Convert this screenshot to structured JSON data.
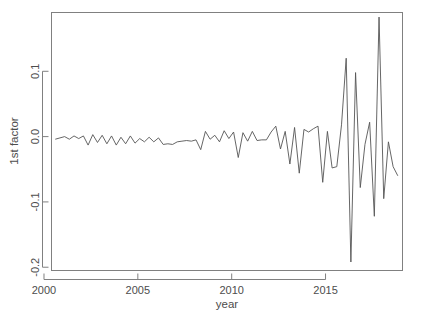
{
  "chart_data": {
    "type": "line",
    "title": "",
    "xlabel": "year",
    "ylabel": "1st factor",
    "xlim": [
      2000.4,
      2019.1
    ],
    "ylim": [
      -0.205,
      0.19
    ],
    "grid": false,
    "legend": "none",
    "x_ticks": [
      "2000",
      "2005",
      "2010",
      "2015"
    ],
    "x_tick_values": [
      2000,
      2005,
      2010,
      2015
    ],
    "y_ticks": [
      "0.1",
      "0.0",
      "-0.1",
      "-0.2"
    ],
    "y_tick_values": [
      0.1,
      0.0,
      -0.1,
      -0.2
    ],
    "series": [
      {
        "name": "1st factor",
        "x": [
          2000.6,
          2000.85,
          2001.1,
          2001.35,
          2001.6,
          2001.85,
          2002.1,
          2002.35,
          2002.6,
          2002.85,
          2003.1,
          2003.35,
          2003.6,
          2003.85,
          2004.1,
          2004.35,
          2004.6,
          2004.85,
          2005.1,
          2005.35,
          2005.6,
          2005.85,
          2006.1,
          2006.35,
          2006.6,
          2006.85,
          2007.1,
          2007.35,
          2007.6,
          2007.85,
          2008.1,
          2008.35,
          2008.6,
          2008.85,
          2009.1,
          2009.35,
          2009.6,
          2009.85,
          2010.1,
          2010.35,
          2010.6,
          2010.85,
          2011.1,
          2011.35,
          2011.6,
          2011.85,
          2012.1,
          2012.35,
          2012.6,
          2012.85,
          2013.1,
          2013.35,
          2013.6,
          2013.85,
          2014.1,
          2014.35,
          2014.6,
          2014.85,
          2015.1,
          2015.35,
          2015.6,
          2015.85,
          2016.1,
          2016.35,
          2016.6,
          2016.85,
          2017.1,
          2017.35,
          2017.6,
          2017.85,
          2018.1,
          2018.35,
          2018.6,
          2018.85
        ],
        "values": [
          -0.004,
          -0.002,
          0.0,
          -0.004,
          0.001,
          -0.003,
          0.001,
          -0.013,
          0.003,
          -0.009,
          0.002,
          -0.011,
          0.001,
          -0.013,
          -0.001,
          -0.011,
          0.001,
          -0.01,
          -0.003,
          -0.008,
          -0.001,
          -0.008,
          -0.002,
          -0.012,
          -0.011,
          -0.012,
          -0.008,
          -0.007,
          -0.006,
          -0.007,
          -0.005,
          -0.02,
          0.008,
          -0.004,
          0.002,
          -0.008,
          0.009,
          -0.003,
          0.007,
          -0.032,
          0.006,
          -0.007,
          0.008,
          -0.006,
          -0.005,
          -0.005,
          0.007,
          0.016,
          -0.019,
          0.008,
          -0.042,
          0.014,
          -0.056,
          0.011,
          0.007,
          0.012,
          0.016,
          -0.07,
          0.008,
          -0.048,
          -0.046,
          0.018,
          0.12,
          -0.192,
          0.098,
          -0.078,
          -0.012,
          0.022,
          -0.122,
          0.183,
          -0.095,
          -0.008,
          -0.046,
          -0.06
        ]
      }
    ]
  },
  "axes": {
    "x_title": "year",
    "y_title": "1st factor"
  }
}
